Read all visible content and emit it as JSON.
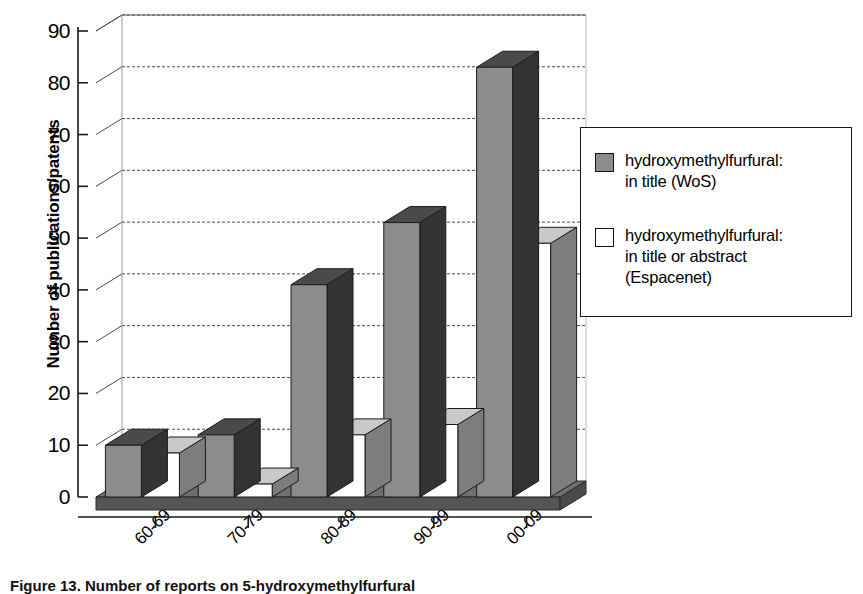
{
  "chart_data": {
    "type": "bar",
    "title": "",
    "subtitle": "",
    "xlabel": "",
    "ylabel": "Number of publications/patents",
    "categories": [
      "60-69",
      "70-79",
      "80-89",
      "90-99",
      "00-09"
    ],
    "series": [
      {
        "name": "hydroxymethylfurfural:\nin title (WoS)",
        "color": "#8c8c8c",
        "values": [
          10,
          12,
          41,
          53,
          83
        ]
      },
      {
        "name": "hydroxymethylfurfural:\nin title or abstract\n(Espacenet)",
        "color": "#ffffff",
        "values": [
          8.5,
          2.5,
          12,
          14,
          49
        ]
      }
    ],
    "ylim": [
      0,
      90
    ],
    "yticks": [
      0,
      10,
      20,
      30,
      40,
      50,
      60,
      70,
      80,
      90
    ],
    "ytick_labels": [
      "0",
      "10",
      "20",
      "30",
      "40",
      "50",
      "60",
      "70",
      "80",
      "90"
    ],
    "grid": true,
    "grid_axis": "y",
    "legend_position": "right",
    "three_d": true,
    "annotations": []
  },
  "legend": {
    "entries": [
      {
        "label": "hydroxymethylfurfural:\nin title (WoS)",
        "swatch_color": "#8c8c8c",
        "swatch_name": "legend-swatch-wos"
      },
      {
        "label": "hydroxymethylfurfural:\nin title or abstract\n(Espacenet)",
        "swatch_color": "#ffffff",
        "swatch_name": "legend-swatch-espacenet"
      }
    ]
  },
  "caption": {
    "text": "Figure 13. Number of reports on 5-hydroxymethylfurfural"
  },
  "colors": {
    "bar_front_dark": "#8c8c8c",
    "bar_side_dark": "#333333",
    "bar_top_dark": "#4a4a4a",
    "bar_front_light": "#ffffff",
    "bar_side_light": "#7d7d7d",
    "bar_top_light": "#c9c9c9",
    "floor": "#6f6f6f",
    "floor_front": "#555555",
    "wall": "#ffffff",
    "gridline": "#4a4a4a",
    "axis": "#1a1a1a"
  }
}
